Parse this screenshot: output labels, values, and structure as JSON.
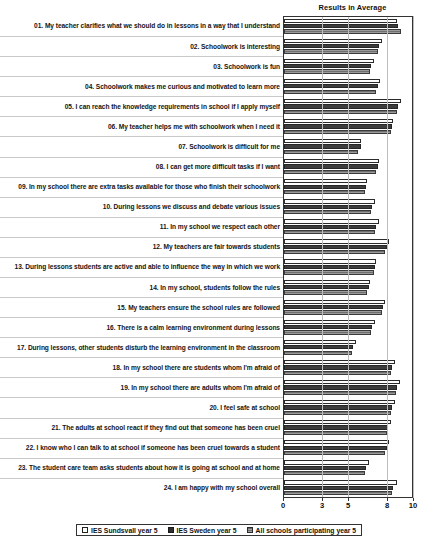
{
  "chart_data": {
    "type": "bar",
    "orientation": "horizontal",
    "title": "Results in Average",
    "xlabel": "",
    "ylabel": "",
    "xlim": [
      0,
      10
    ],
    "xticks": [
      0,
      3,
      5,
      8,
      10
    ],
    "grid": true,
    "legend_position": "bottom",
    "categories": [
      "01. My teacher clarifies what we should do in lessons in a way that I understand",
      "02. Schoolwork is interesting",
      "03. Schoolwork is fun",
      "04. Schoolwork makes me curious and motivated to learn more",
      "05. I can reach the knowledge requirements in school if I apply myself",
      "06. My teacher helps me with schoolwork when I need it",
      "07. Schoolwork is difficult for me",
      "08. I can get more difficult tasks if I want",
      "09. In my school there are extra tasks available for those who finish their schoolwork",
      "10. During lessons we discuss and debate various issues",
      "11. In my school we respect each other",
      "12. My teachers are fair towards students",
      "13. During lessons students are active and able to influence the way in which we work",
      "14. In my school, students follow the rules",
      "15. My teachers ensure the school rules are followed",
      "16. There is a calm learning environment during lessons",
      "17. During lessons, other students disturb the learning environment in the classroom",
      "18. In my school there are students whom I'm afraid of",
      "19. In my school there are adults whom I'm afraid of",
      "20. I feel safe at school",
      "21. The adults at school react if they find out that someone has been cruel",
      "22. I know who I can talk to at school if someone has been cruel towards a student",
      "23. The student care team asks students about how it is going at school and at home",
      "24. I am happy with my school overall"
    ],
    "series": [
      {
        "name": "IES Sundsvall year 5",
        "values": [
          8.7,
          7.5,
          6.9,
          7.4,
          9.0,
          8.4,
          5.9,
          7.3,
          6.4,
          7.0,
          7.3,
          8.1,
          7.1,
          6.6,
          7.8,
          7.0,
          5.5,
          8.5,
          8.9,
          8.5,
          8.2,
          8.1,
          6.5,
          8.7
        ]
      },
      {
        "name": "IES Sweden year 5",
        "values": [
          8.8,
          7.3,
          6.7,
          7.2,
          8.8,
          8.3,
          5.9,
          7.2,
          6.3,
          6.8,
          7.1,
          7.9,
          7.0,
          6.5,
          7.6,
          6.8,
          5.3,
          8.3,
          8.7,
          8.3,
          8.0,
          7.9,
          6.3,
          8.4
        ]
      },
      {
        "name": "All schools participating year 5",
        "values": [
          9.0,
          7.2,
          6.6,
          7.1,
          8.7,
          8.2,
          5.7,
          7.1,
          6.2,
          6.7,
          7.0,
          7.8,
          6.9,
          6.4,
          7.5,
          6.7,
          5.2,
          8.2,
          8.6,
          8.2,
          7.9,
          7.8,
          6.2,
          8.3
        ]
      }
    ]
  },
  "colors": {
    "series0": "#ffffff",
    "series1": "#3d3d3d",
    "series2": "#8a8a8a",
    "axis": "#333333",
    "grid": "#bdbdbd",
    "text": "#111111"
  }
}
